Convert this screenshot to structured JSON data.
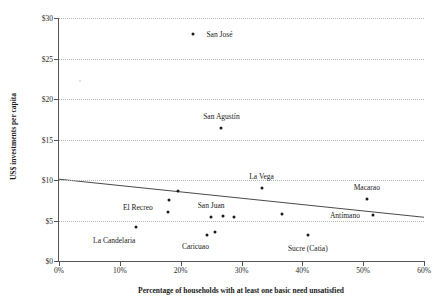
{
  "chart_data": {
    "type": "scatter",
    "title": "",
    "xlabel": "Percentage of households with at least one basic need unsatisfied",
    "ylabel": "US$ investments per capita",
    "xlim": [
      0,
      60
    ],
    "ylim": [
      0,
      30
    ],
    "x_tick_labels": [
      "0%",
      "10%",
      "20%",
      "30%",
      "40%",
      "50%",
      "60%"
    ],
    "x_tick_values": [
      0,
      10,
      20,
      30,
      40,
      50,
      60
    ],
    "y_tick_labels": [
      "$0",
      "$5",
      "$10",
      "$15",
      "$20",
      "$25",
      "$30"
    ],
    "y_tick_values": [
      0,
      5,
      10,
      15,
      20,
      25,
      30
    ],
    "grid": "horizontal-dotted",
    "legend": "none",
    "points": [
      {
        "label": "San José",
        "x": 22.1,
        "y": 28.0,
        "label_dx": 26,
        "label_dy": -0.5,
        "faint": false
      },
      {
        "label": "",
        "x": 3.4,
        "y": 22.2,
        "label_dx": 0,
        "label_dy": 0,
        "faint": true
      },
      {
        "label": "San Agustín",
        "x": 26.7,
        "y": 16.4,
        "label_dx": 0,
        "label_dy": -12,
        "faint": false
      },
      {
        "label": "La Vega",
        "x": 33.3,
        "y": 9.0,
        "label_dx": 0,
        "label_dy": -12,
        "faint": false
      },
      {
        "label": "Macarao",
        "x": 50.6,
        "y": 7.7,
        "label_dx": 0,
        "label_dy": -12,
        "faint": false
      },
      {
        "label": "",
        "x": 19.6,
        "y": 8.6,
        "label_dx": 0,
        "label_dy": 0,
        "faint": false
      },
      {
        "label": "",
        "x": 18.0,
        "y": 7.5,
        "label_dx": 0,
        "label_dy": 0,
        "faint": false
      },
      {
        "label": "El Recreo",
        "x": 17.9,
        "y": 6.1,
        "label_dx": -30,
        "label_dy": -5,
        "faint": false
      },
      {
        "label": "San Juan",
        "x": 25.0,
        "y": 5.4,
        "label_dx": 0,
        "label_dy": -12,
        "faint": false
      },
      {
        "label": "",
        "x": 26.9,
        "y": 5.6,
        "label_dx": 0,
        "label_dy": 0,
        "faint": false
      },
      {
        "label": "",
        "x": 28.7,
        "y": 5.4,
        "label_dx": 0,
        "label_dy": 0,
        "faint": false
      },
      {
        "label": "",
        "x": 36.6,
        "y": 5.8,
        "label_dx": 0,
        "label_dy": 0,
        "faint": false
      },
      {
        "label": "Antímano",
        "x": 51.6,
        "y": 5.7,
        "label_dx": -28,
        "label_dy": 0,
        "faint": false
      },
      {
        "label": "La Candelaria",
        "x": 12.7,
        "y": 4.2,
        "label_dx": -22,
        "label_dy": 13,
        "faint": false
      },
      {
        "label": "Caricuao",
        "x": 24.4,
        "y": 3.2,
        "label_dx": -12,
        "label_dy": 11,
        "faint": false
      },
      {
        "label": "",
        "x": 25.6,
        "y": 3.6,
        "label_dx": 0,
        "label_dy": 0,
        "faint": false
      },
      {
        "label": "Sucre (Catia)",
        "x": 40.9,
        "y": 3.2,
        "label_dx": 0,
        "label_dy": 13,
        "faint": false
      }
    ],
    "trend_line": {
      "type": "linear",
      "x_start": 0,
      "y_start": 10.1,
      "x_end": 60,
      "y_end": 5.4,
      "color": "#4a4a4a"
    }
  }
}
